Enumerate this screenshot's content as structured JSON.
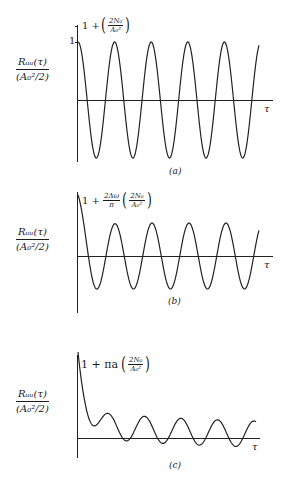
{
  "figure": {
    "ylabel_num": "Rᵤᵤ(τ)",
    "ylabel_den": "(A₀²/2)",
    "xlabel": "τ",
    "panels": [
      {
        "caption": "(a)",
        "annotation_prefix": "1 +",
        "annotation_coef": "",
        "annotation_frac_num": "2N₀",
        "annotation_frac_den": "A₀²",
        "tick_label": "1"
      },
      {
        "caption": "(b)",
        "annotation_prefix": "1 +",
        "annotation_coef_num": "2Δω",
        "annotation_coef_den": "π",
        "annotation_frac_num": "2N₀",
        "annotation_frac_den": "A₀²"
      },
      {
        "caption": "(c)",
        "annotation_prefix": "1 + πa",
        "annotation_frac_num": "2N₀",
        "annotation_frac_den": "A₀²"
      }
    ]
  },
  "chart_data": [
    {
      "type": "line",
      "title": "(a)",
      "xlabel": "τ",
      "ylabel": "R_uu(τ) / (A0²/2)",
      "description": "Pure cosine autocorrelation: cos(ω₀τ) with a noise spike 1 + 2N0/A0² at τ=0",
      "annotations": [
        "1 + (2N0/A0²)",
        "1"
      ],
      "x": [
        0,
        0.5,
        1,
        1.5,
        2,
        2.5,
        3,
        3.5,
        4,
        4.5,
        5,
        5.5,
        6,
        6.5,
        7,
        7.5,
        8,
        8.5,
        9,
        9.5,
        10
      ],
      "series": [
        {
          "name": "R_uu normalized",
          "values": [
            1,
            0,
            -1,
            0,
            1,
            0,
            -1,
            0,
            1,
            0,
            -1,
            0,
            1,
            0,
            -1,
            0,
            1,
            0,
            -1,
            0,
            0.8
          ]
        }
      ],
      "ylim": [
        -1,
        1.4
      ],
      "grid": false
    },
    {
      "type": "line",
      "title": "(b)",
      "xlabel": "τ",
      "ylabel": "R_uu(τ) / (A0²/2)",
      "description": "Cosine plus band-limited noise; decaying oscillation at origin from 1 + (2Δω/π)(2N0/A0²)",
      "annotations": [
        "1 + (2Δω/π)(2N0/A0²)"
      ],
      "x": [
        0,
        0.5,
        1,
        1.5,
        2,
        2.5,
        3,
        3.5,
        4,
        4.5,
        5,
        5.5,
        6,
        6.5,
        7,
        7.5,
        8,
        8.5,
        9,
        9.5,
        10
      ],
      "series": [
        {
          "name": "R_uu normalized",
          "values": [
            2.6,
            0,
            -1.7,
            0,
            1.25,
            0,
            -0.6,
            0,
            1.2,
            0,
            -1.15,
            0,
            1.2,
            0,
            -0.85,
            0,
            1.2,
            0,
            -1.15,
            0,
            0.9
          ]
        }
      ],
      "ylim": [
        -2,
        2.8
      ],
      "grid": false
    },
    {
      "type": "line",
      "title": "(c)",
      "xlabel": "τ",
      "ylabel": "R_uu(τ) / (A0²/2)",
      "description": "Cosine plus exponentially correlated noise; sharp decay from 1 + πa(2N0/A0²) to offset oscillations",
      "annotations": [
        "1 + πa(2N0/A0²)"
      ],
      "x": [
        0,
        0.5,
        1,
        1.5,
        2,
        2.5,
        3,
        3.5,
        4,
        4.5,
        5,
        5.5,
        6,
        6.5,
        7,
        7.5,
        8,
        8.5,
        9,
        9.5,
        10
      ],
      "series": [
        {
          "name": "R_uu normalized",
          "values": [
            5.6,
            1.5,
            1.0,
            1.6,
            2.2,
            1.2,
            -0.5,
            0.8,
            1.9,
            0.8,
            -0.7,
            0.6,
            1.7,
            0.6,
            -0.9,
            0.5,
            1.6,
            0.3,
            -1.2,
            0.2,
            1.0
          ]
        }
      ],
      "ylim": [
        -1.5,
        6
      ],
      "grid": false
    }
  ]
}
